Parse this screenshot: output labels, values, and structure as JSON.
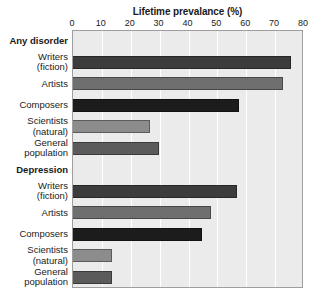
{
  "chart_data": {
    "type": "bar",
    "orientation": "horizontal",
    "title": "Lifetime prevalance (%)",
    "xlabel": "",
    "ylabel": "",
    "xlim": [
      0,
      80
    ],
    "xticks": [
      0,
      10,
      20,
      30,
      40,
      50,
      60,
      70,
      80
    ],
    "grid": true,
    "legend": "none",
    "groups": [
      {
        "name": "Any disorder",
        "rows": [
          {
            "label_lines": [
              "Writers",
              "(fiction)"
            ],
            "value": 76,
            "color": "#3c3c3c"
          },
          {
            "label_lines": [
              "Artists"
            ],
            "value": 73,
            "color": "#6f6f6f"
          },
          {
            "label_lines": [
              "Composers"
            ],
            "value": 58,
            "color": "#1c1c1c"
          },
          {
            "label_lines": [
              "Scientists",
              "(natural)"
            ],
            "value": 27,
            "color": "#8c8c8c"
          },
          {
            "label_lines": [
              "General",
              "population"
            ],
            "value": 30,
            "color": "#5b5b5b"
          }
        ]
      },
      {
        "name": "Depression",
        "rows": [
          {
            "label_lines": [
              "Writers",
              "(fiction)"
            ],
            "value": 57,
            "color": "#3c3c3c"
          },
          {
            "label_lines": [
              "Artists"
            ],
            "value": 48,
            "color": "#6f6f6f"
          },
          {
            "label_lines": [
              "Composers"
            ],
            "value": 45,
            "color": "#1c1c1c"
          },
          {
            "label_lines": [
              "Scientists",
              "(natural)"
            ],
            "value": 14,
            "color": "#8c8c8c"
          },
          {
            "label_lines": [
              "General",
              "population"
            ],
            "value": 14,
            "color": "#5b5b5b"
          }
        ]
      }
    ],
    "categories": [
      "Any disorder",
      "Writers (fiction)",
      "Artists",
      "Composers",
      "Scientists (natural)",
      "General population",
      "Depression",
      "Writers (fiction)",
      "Artists",
      "Composers",
      "Scientists (natural)",
      "General population"
    ],
    "values": [
      null,
      76,
      73,
      58,
      27,
      30,
      null,
      57,
      48,
      45,
      14,
      14
    ]
  },
  "colors": {
    "plot_background": "#ebebeb",
    "gridline": "#ffffff",
    "plot_border": "#9e9e9e",
    "text": "#1a1a1a",
    "page_background": "#ffffff"
  }
}
